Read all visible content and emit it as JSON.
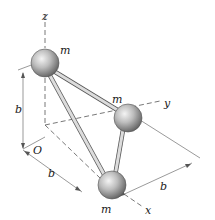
{
  "diagram": {
    "type": "3d-mechanics-figure",
    "axes": {
      "x_label": "x",
      "y_label": "y",
      "z_label": "z",
      "origin_label": "O"
    },
    "masses": [
      {
        "label": "m",
        "position": "on z-axis at height b"
      },
      {
        "label": "m",
        "position": "on y-axis at distance b"
      },
      {
        "label": "m",
        "position": "on x-axis at distance b"
      }
    ],
    "dimensions": {
      "vertical": "b",
      "along_x": "b",
      "along_y": "b"
    },
    "colors": {
      "ball_light": "#e8e8e8",
      "ball_dark": "#6e6e6e",
      "rod": "#d0d0d0",
      "rod_edge": "#555555",
      "axis": "#555555"
    }
  }
}
